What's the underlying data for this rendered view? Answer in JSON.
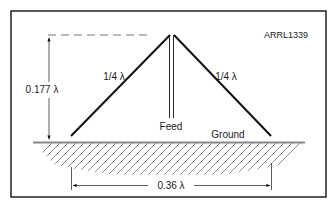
{
  "figure_id": "ARRL1339",
  "labels": {
    "height": "0.177 λ",
    "left_leg": "1/4 λ",
    "right_leg": "1/4 λ",
    "feed": "Feed",
    "ground": "Ground",
    "base_width": "0.36 λ"
  },
  "colors": {
    "line": "#111111",
    "ground": "#888888",
    "hatch": "#777777"
  }
}
